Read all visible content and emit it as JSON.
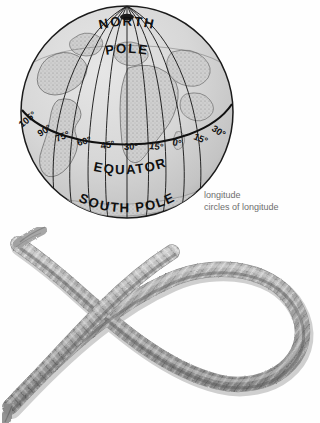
{
  "page": {
    "background_color": "#ffffff",
    "figures": [
      "globe-longitude-diagram",
      "rope-loop-photograph"
    ]
  },
  "globe": {
    "north_pole_label": "NORTH",
    "north_pole_label_line2": "POLE",
    "equator_label": "EQUATOR",
    "south_pole_label": "SOUTH POLE",
    "line_color": "#1b1b1b",
    "ocean_color": "#d8d8d8",
    "land_color": "#bdbdbd",
    "longitude_labels": [
      "105°",
      "90°",
      "75°",
      "60°",
      "45°",
      "30°",
      "15°",
      "0°",
      "15°",
      "30°"
    ],
    "caption": {
      "headword": "longitude",
      "gloss": "circles of longitude",
      "color": "#6e6e6e"
    }
  },
  "rope": {
    "caption": "loop (definition 1)",
    "caption_color": "#5f5f5f",
    "fiber_color": "#9a9a9a",
    "shadow_color": "#4a4a4a"
  }
}
